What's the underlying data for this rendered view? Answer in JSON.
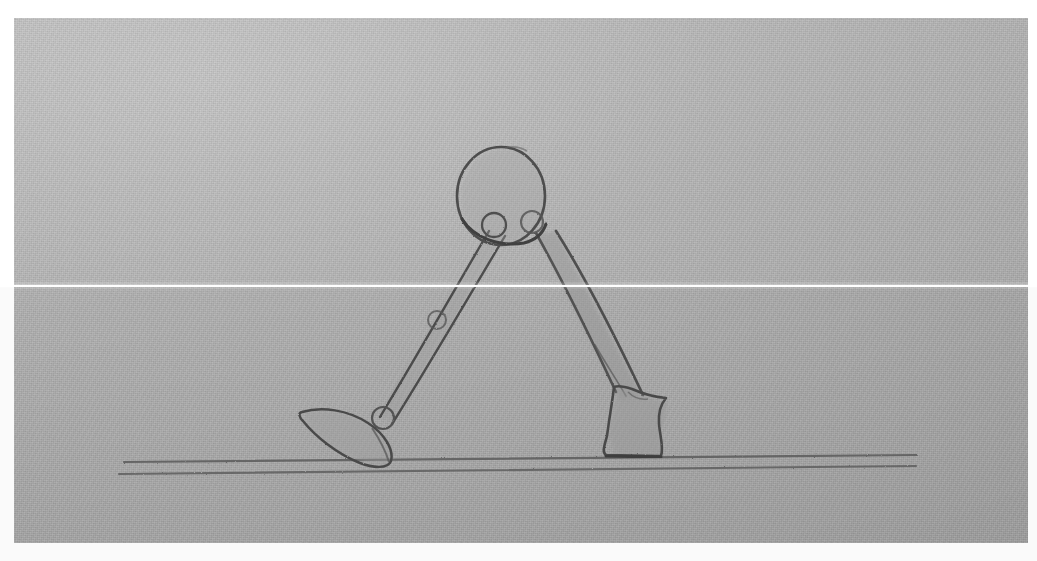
{
  "image": {
    "title": "Pencil sketch of a two-legged walking figure",
    "medium": "graphite pencil on textured gray paper",
    "width": 1037,
    "height": 561,
    "background_color": "#ffffff",
    "paper_color": "#adadad",
    "graphite_color": "#4a4a4a",
    "shading_color": "#9a9a9a",
    "paper_region": {
      "x": 14,
      "y": 18,
      "width": 1014,
      "height": 525
    }
  },
  "artifacts": {
    "scan_line": {
      "label": "white horizontal scanner seam",
      "y": 285,
      "thickness": 2,
      "color": "#ffffff"
    }
  },
  "subject": {
    "name": "walking figure",
    "description": "Round body with two tapered legs in a mid-stride walking pose standing on a ground line",
    "parts": [
      {
        "name": "body-circle",
        "label": "Round body / head",
        "cx": 501,
        "cy": 196,
        "rx": 44,
        "ry": 49
      },
      {
        "name": "hip-joint-left",
        "label": "Left hip joint",
        "cx": 494,
        "cy": 225,
        "r": 12
      },
      {
        "name": "hip-joint-right",
        "label": "Right hip joint",
        "cx": 532,
        "cy": 222,
        "r": 11
      },
      {
        "name": "left-leg",
        "label": "Left leg (rear, thin)",
        "from": [
          495,
          228
        ],
        "to": [
          383,
          420
        ]
      },
      {
        "name": "knee-joint-left",
        "label": "Left knee joint",
        "cx": 437,
        "cy": 320,
        "r": 9
      },
      {
        "name": "ankle-joint-left",
        "label": "Left ankle joint",
        "cx": 383,
        "cy": 418,
        "r": 11
      },
      {
        "name": "left-foot",
        "label": "Left foot, pointed toe facing left",
        "toe": [
          299,
          412
        ],
        "heel": [
          392,
          466
        ]
      },
      {
        "name": "right-leg",
        "label": "Right leg (front, shaded and tapered)",
        "from": [
          538,
          230
        ],
        "to": [
          628,
          400
        ]
      },
      {
        "name": "right-foot",
        "label": "Right boot-shaped foot",
        "top": [
          612,
          385
        ],
        "sole": [
          608,
          457
        ]
      }
    ]
  },
  "ground": {
    "label": "Ground line (double stroke)",
    "lines": [
      {
        "name": "ground-line-upper",
        "x1": 124,
        "y1": 462,
        "x2": 917,
        "y2": 455
      },
      {
        "name": "ground-line-lower",
        "x1": 119,
        "y1": 474,
        "x2": 916,
        "y2": 466
      }
    ]
  }
}
